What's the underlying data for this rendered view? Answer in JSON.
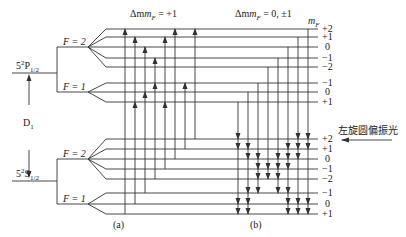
{
  "colors": {
    "line": "#333333",
    "text": "#222222",
    "background": "#ffffff"
  },
  "labels": {
    "transition_a_header": "Δm",
    "transition_a_sub": "F",
    "transition_a_value": " = +1",
    "transition_b_header": "Δm",
    "transition_b_sub": "F",
    "transition_b_value": " = 0, ±1",
    "mf_header": "m",
    "mf_sub": "F",
    "upper_state": "5",
    "upper_state_sup": "2",
    "upper_state_main": "P",
    "upper_state_sub": "1/2",
    "lower_state": "5",
    "lower_state_sup": "2",
    "lower_state_main": "S",
    "lower_state_sub": "1/2",
    "d1": "D",
    "d1_sub": "1",
    "upper_F2": "F = 2",
    "upper_F1": "F = 1",
    "lower_F2": "F = 2",
    "lower_F1": "F = 1",
    "panel_a": "(a)",
    "panel_b": "(b)",
    "light_label": "左旋圆偏振光"
  },
  "mf_values_upper": [
    "+2",
    "+1",
    "0",
    "−1",
    "−2",
    "−1",
    "0",
    "+1"
  ],
  "mf_values_lower": [
    "+2",
    "+1",
    "0",
    "−1",
    "−2",
    "−1",
    "0",
    "+1"
  ]
}
